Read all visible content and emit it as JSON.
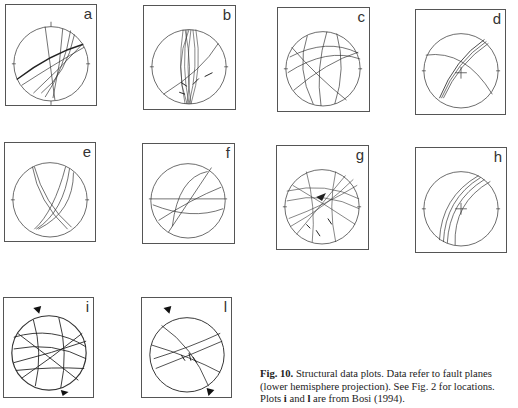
{
  "figure": {
    "caption": {
      "label": "Fig. 10.",
      "text_1": " Structural data plots. Data refer to fault planes (lower hemisphere projection). See Fig. 2 for locations. Plots ",
      "bold_i": "i",
      "text_2": " and ",
      "bold_l": "l",
      "text_3": " are from Bosi (1994)."
    },
    "north_label": "N",
    "south_label": "S",
    "plots": [
      {
        "id": "a",
        "label": "a"
      },
      {
        "id": "b",
        "label": "b"
      },
      {
        "id": "c",
        "label": "c"
      },
      {
        "id": "d",
        "label": "d"
      },
      {
        "id": "e",
        "label": "e"
      },
      {
        "id": "f",
        "label": "f"
      },
      {
        "id": "g",
        "label": "g"
      },
      {
        "id": "h",
        "label": "h"
      },
      {
        "id": "i",
        "label": "i"
      },
      {
        "id": "l",
        "label": "l"
      }
    ]
  }
}
